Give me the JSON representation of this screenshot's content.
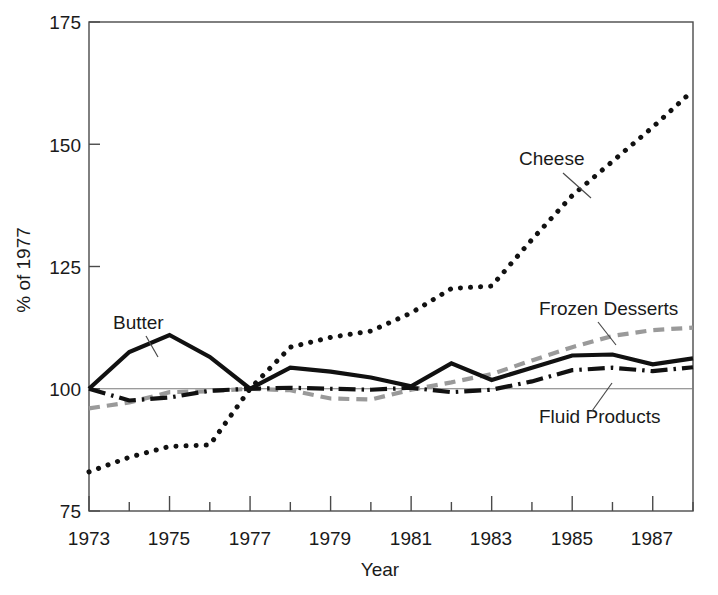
{
  "chart_data": {
    "type": "line",
    "title": "",
    "subtitle": "",
    "xlabel": "Year",
    "ylabel": "% of 1977",
    "xlim": [
      1973,
      1988
    ],
    "ylim": [
      75,
      175
    ],
    "yticks": [
      75,
      100,
      125,
      150,
      175
    ],
    "ytick_labels": [
      "75",
      "100",
      "125",
      "150",
      "175"
    ],
    "xticks": [
      1973,
      1974,
      1975,
      1976,
      1977,
      1978,
      1979,
      1980,
      1981,
      1982,
      1983,
      1984,
      1985,
      1986,
      1987,
      1988
    ],
    "xtick_labels": [
      "1973",
      "",
      "1975",
      "",
      "1977",
      "",
      "1979",
      "",
      "1981",
      "",
      "1983",
      "",
      "1985",
      "",
      "1987",
      ""
    ],
    "xtick_labels_major": [
      "1973",
      "1975",
      "1977",
      "1979",
      "1981",
      "1983",
      "1985",
      "1987"
    ],
    "grid": "reference line at 100",
    "reference_line": 100,
    "legend_position": "inline annotations",
    "x": [
      1973,
      1974,
      1975,
      1976,
      1977,
      1978,
      1979,
      1980,
      1981,
      1982,
      1983,
      1984,
      1985,
      1986,
      1987,
      1988
    ],
    "series": [
      {
        "name": "Butter",
        "style": "solid",
        "color": "#111111",
        "values": [
          100.0,
          107.5,
          111.0,
          106.5,
          100.0,
          104.3,
          103.5,
          102.3,
          100.5,
          105.2,
          101.8,
          104.3,
          106.8,
          107.0,
          105.0,
          106.2
        ]
      },
      {
        "name": "Cheese",
        "style": "dotted",
        "color": "#111111",
        "values": [
          83.0,
          86.0,
          88.2,
          88.5,
          100.0,
          108.5,
          110.5,
          111.8,
          115.5,
          120.5,
          121.0,
          130.5,
          139.5,
          146.5,
          153.5,
          161.0
        ]
      },
      {
        "name": "Frozen Desserts",
        "style": "gray-dashed",
        "color": "#9a9a9a",
        "values": [
          96.0,
          97.2,
          99.3,
          99.5,
          100.0,
          99.7,
          98.0,
          97.8,
          99.8,
          101.3,
          103.0,
          105.8,
          108.5,
          110.8,
          112.0,
          112.5
        ]
      },
      {
        "name": "Fluid Products",
        "style": "dash-dot",
        "color": "#111111",
        "values": [
          100.0,
          97.6,
          98.2,
          99.6,
          100.0,
          100.2,
          100.0,
          99.8,
          100.2,
          99.3,
          99.8,
          101.5,
          103.8,
          104.3,
          103.6,
          104.4
        ]
      }
    ],
    "annotations": [
      {
        "text": "Butter",
        "series": "Butter"
      },
      {
        "text": "Cheese",
        "series": "Cheese"
      },
      {
        "text": "Frozen Desserts",
        "series": "Frozen Desserts"
      },
      {
        "text": "Fluid Products",
        "series": "Fluid Products"
      }
    ]
  },
  "labels": {
    "y_axis_title": "% of 1977",
    "x_axis_title": "Year",
    "butter": "Butter",
    "cheese": "Cheese",
    "frozen_desserts": "Frozen Desserts",
    "fluid_products": "Fluid Products",
    "ytick_75": "75",
    "ytick_100": "100",
    "ytick_125": "125",
    "ytick_150": "150",
    "ytick_175": "175",
    "xtick_1973": "1973",
    "xtick_1975": "1975",
    "xtick_1977": "1977",
    "xtick_1979": "1979",
    "xtick_1981": "1981",
    "xtick_1983": "1983",
    "xtick_1985": "1985",
    "xtick_1987": "1987"
  }
}
